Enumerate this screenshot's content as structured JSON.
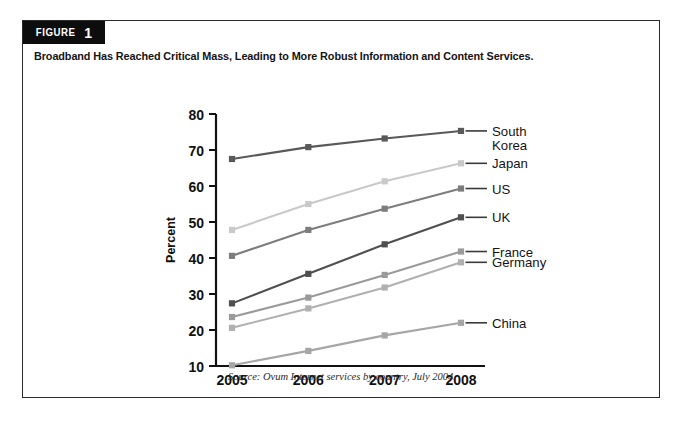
{
  "figure": {
    "badge_word": "FIGURE",
    "badge_number": "1",
    "headline": "Broadband Has Reached Critical Mass, Leading to More Robust Information and Content Services.",
    "source": "Source: Ovum Internet services by country, July 2004."
  },
  "colors": {
    "frame": "#2b2b2b",
    "badge_bg": "#0d0d0d",
    "badge_text": "#ffffff",
    "axis": "#111111",
    "text": "#141414",
    "south_korea": "#595959",
    "japan": "#c9c9c9",
    "us": "#7d7d7d",
    "uk": "#4f4f4f",
    "france": "#9a9a9a",
    "germany": "#b0b0b0",
    "china": "#a6a6a6"
  },
  "chart_data": {
    "type": "line",
    "title": "Broadband Has Reached Critical Mass, Leading to More Robust Information and Content Services.",
    "xlabel": "",
    "ylabel": "Percent",
    "categories": [
      "2005",
      "2006",
      "2007",
      "2008"
    ],
    "x": [
      2005,
      2006,
      2007,
      2008
    ],
    "ylim": [
      10,
      80
    ],
    "yticks": [
      10,
      20,
      30,
      40,
      50,
      60,
      70,
      80
    ],
    "ytick_labels": [
      "10",
      "20",
      "30",
      "40",
      "50",
      "60",
      "70",
      "80"
    ],
    "grid": false,
    "legend": "right-of-plot-direct-labels",
    "marker": "square",
    "series": [
      {
        "name": "South Korea",
        "values": [
          67.5,
          70.8,
          73.2,
          75.3
        ],
        "color": "#595959",
        "label_lines": [
          "South",
          "Korea"
        ]
      },
      {
        "name": "Japan",
        "values": [
          47.8,
          55.0,
          61.3,
          66.3
        ],
        "color": "#c9c9c9",
        "label_lines": [
          "Japan"
        ]
      },
      {
        "name": "US",
        "values": [
          40.6,
          47.8,
          53.7,
          59.3
        ],
        "color": "#7d7d7d",
        "label_lines": [
          "US"
        ]
      },
      {
        "name": "UK",
        "values": [
          27.4,
          35.6,
          43.8,
          51.3
        ],
        "color": "#4f4f4f",
        "label_lines": [
          "UK"
        ]
      },
      {
        "name": "France",
        "values": [
          23.6,
          29.0,
          35.3,
          41.8
        ],
        "color": "#9a9a9a",
        "label_lines": [
          "France"
        ]
      },
      {
        "name": "Germany",
        "values": [
          20.6,
          26.0,
          31.8,
          38.8
        ],
        "color": "#b0b0b0",
        "label_lines": [
          "Germany"
        ]
      },
      {
        "name": "China",
        "values": [
          10.2,
          14.2,
          18.5,
          22.0
        ],
        "color": "#a6a6a6",
        "label_lines": [
          "China"
        ]
      }
    ]
  }
}
